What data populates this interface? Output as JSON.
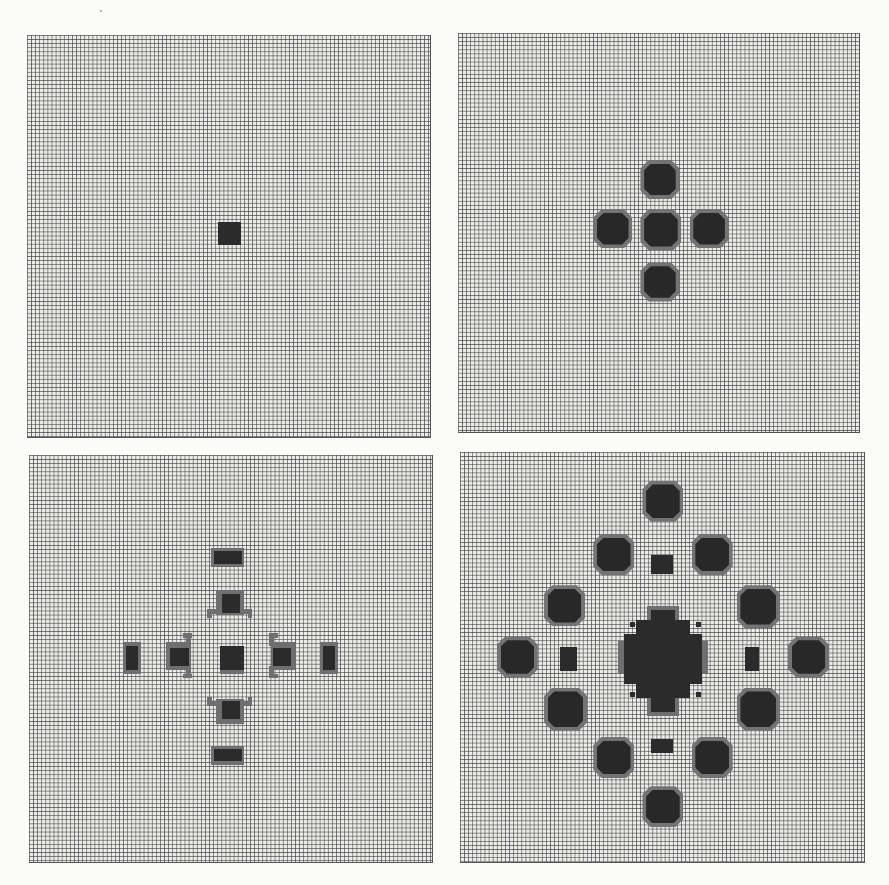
{
  "figure": {
    "background": "#fbfbfa",
    "grid_color": "#464646",
    "cell_fill_color": "#2b2b2b",
    "edge_fill_color": "#6f6f6f",
    "cell_px": 4.1,
    "grid_cells": 98
  },
  "panels": [
    {
      "id": "top-left",
      "label": "state-1",
      "x": 27,
      "y": 35,
      "w": 404,
      "h": 403,
      "rects": [
        {
          "col": 46.5,
          "row": 45.5,
          "w": 5.8,
          "h": 5.8,
          "tone": "core"
        }
      ],
      "blobs": []
    },
    {
      "id": "top-right",
      "label": "state-2",
      "x": 458,
      "y": 33,
      "w": 402,
      "h": 400,
      "rects": [],
      "blobs": [
        {
          "col": 44.5,
          "row": 31,
          "size": 9.5
        },
        {
          "col": 33,
          "row": 43,
          "size": 9.5
        },
        {
          "col": 44.5,
          "row": 43,
          "size": 10
        },
        {
          "col": 56.5,
          "row": 43,
          "size": 9.5
        },
        {
          "col": 44.5,
          "row": 56,
          "size": 9.5
        }
      ]
    },
    {
      "id": "bottom-left",
      "label": "state-3",
      "x": 29,
      "y": 455,
      "w": 404,
      "h": 408,
      "rects": [
        {
          "col": 45,
          "row": 23.5,
          "w": 7,
          "h": 3,
          "tone": "core"
        },
        {
          "col": 44.5,
          "row": 22.7,
          "w": 8,
          "h": 4.6,
          "tone": "halo"
        },
        {
          "col": 45,
          "row": 71.7,
          "w": 7,
          "h": 3,
          "tone": "core"
        },
        {
          "col": 44.5,
          "row": 70.9,
          "w": 8,
          "h": 4.6,
          "tone": "halo"
        },
        {
          "col": 23.6,
          "row": 46.5,
          "w": 3,
          "h": 6,
          "tone": "core"
        },
        {
          "col": 23,
          "row": 45.7,
          "w": 4.4,
          "h": 7.6,
          "tone": "halo"
        },
        {
          "col": 71.7,
          "row": 46.5,
          "w": 3,
          "h": 6,
          "tone": "core"
        },
        {
          "col": 71,
          "row": 45.7,
          "w": 4.4,
          "h": 7.6,
          "tone": "halo"
        },
        {
          "col": 47,
          "row": 34,
          "w": 4.5,
          "h": 4.5,
          "tone": "core"
        },
        {
          "col": 45.5,
          "row": 33,
          "w": 7,
          "h": 6,
          "tone": "halo"
        },
        {
          "col": 43.5,
          "row": 37.5,
          "w": 1.2,
          "h": 2.2,
          "tone": "halo"
        },
        {
          "col": 43.5,
          "row": 37.5,
          "w": 3,
          "h": 1.2,
          "tone": "halo"
        },
        {
          "col": 53.3,
          "row": 37.5,
          "w": 1.2,
          "h": 2.2,
          "tone": "halo"
        },
        {
          "col": 51.5,
          "row": 37.5,
          "w": 3,
          "h": 1.2,
          "tone": "halo"
        },
        {
          "col": 47,
          "row": 60,
          "w": 4.5,
          "h": 4.5,
          "tone": "core"
        },
        {
          "col": 45.5,
          "row": 59.5,
          "w": 7,
          "h": 6,
          "tone": "halo"
        },
        {
          "col": 43.5,
          "row": 59,
          "w": 1.2,
          "h": 2.2,
          "tone": "halo"
        },
        {
          "col": 43.5,
          "row": 60,
          "w": 3,
          "h": 1.2,
          "tone": "halo"
        },
        {
          "col": 53.3,
          "row": 59,
          "w": 1.2,
          "h": 2.2,
          "tone": "halo"
        },
        {
          "col": 51.5,
          "row": 60,
          "w": 3,
          "h": 1.2,
          "tone": "halo"
        },
        {
          "col": 34.5,
          "row": 47,
          "w": 4.5,
          "h": 4.5,
          "tone": "core"
        },
        {
          "col": 33.5,
          "row": 45.5,
          "w": 6,
          "h": 7,
          "tone": "halo"
        },
        {
          "col": 37.5,
          "row": 43.5,
          "w": 2.2,
          "h": 1.2,
          "tone": "halo"
        },
        {
          "col": 38.3,
          "row": 43.5,
          "w": 1.2,
          "h": 3,
          "tone": "halo"
        },
        {
          "col": 37.5,
          "row": 53.3,
          "w": 2.2,
          "h": 1.2,
          "tone": "halo"
        },
        {
          "col": 38.3,
          "row": 51.5,
          "w": 1.2,
          "h": 3,
          "tone": "halo"
        },
        {
          "col": 59.5,
          "row": 47,
          "w": 4.5,
          "h": 4.5,
          "tone": "core"
        },
        {
          "col": 59,
          "row": 45.5,
          "w": 6,
          "h": 7,
          "tone": "halo"
        },
        {
          "col": 58.5,
          "row": 43.5,
          "w": 2.2,
          "h": 1.2,
          "tone": "halo"
        },
        {
          "col": 58.5,
          "row": 43.5,
          "w": 1.2,
          "h": 3,
          "tone": "halo"
        },
        {
          "col": 58.5,
          "row": 53.3,
          "w": 2.2,
          "h": 1.2,
          "tone": "halo"
        },
        {
          "col": 58.5,
          "row": 51.5,
          "w": 1.2,
          "h": 3,
          "tone": "halo"
        },
        {
          "col": 46.5,
          "row": 46.5,
          "w": 6,
          "h": 6,
          "tone": "core"
        },
        {
          "col": 46.5,
          "row": 52.3,
          "w": 6,
          "h": 1.2,
          "tone": "halo"
        }
      ],
      "blobs": []
    },
    {
      "id": "bottom-right",
      "label": "state-4",
      "x": 460,
      "y": 452,
      "w": 405,
      "h": 411,
      "rects": [
        {
          "col": 46.5,
          "row": 25.2,
          "w": 5.5,
          "h": 4.5,
          "tone": "core"
        },
        {
          "col": 46.5,
          "row": 70,
          "w": 5.5,
          "h": 3.5,
          "tone": "core"
        },
        {
          "col": 24.5,
          "row": 47.5,
          "w": 4,
          "h": 6,
          "tone": "core"
        },
        {
          "col": 69.5,
          "row": 47.5,
          "w": 3.5,
          "h": 6,
          "tone": "core"
        },
        {
          "col": 46.5,
          "row": 38.5,
          "w": 6,
          "h": 25,
          "tone": "core"
        },
        {
          "col": 40,
          "row": 44.5,
          "w": 19,
          "h": 12,
          "tone": "core"
        },
        {
          "col": 43,
          "row": 41,
          "w": 13,
          "h": 19,
          "tone": "core"
        },
        {
          "col": 38.5,
          "row": 46,
          "w": 22,
          "h": 8,
          "tone": "halo"
        },
        {
          "col": 45.5,
          "row": 37.5,
          "w": 8,
          "h": 27,
          "tone": "halo"
        },
        {
          "col": 41.5,
          "row": 41.5,
          "w": 1.2,
          "h": 1.2,
          "tone": "core"
        },
        {
          "col": 57.5,
          "row": 41.5,
          "w": 1.2,
          "h": 1.2,
          "tone": "core"
        },
        {
          "col": 41.5,
          "row": 58.5,
          "w": 1.2,
          "h": 1.2,
          "tone": "core"
        },
        {
          "col": 57.5,
          "row": 58.5,
          "w": 1.2,
          "h": 1.2,
          "tone": "core"
        }
      ],
      "blobs": [
        {
          "col": 44.5,
          "row": 7,
          "size": 10
        },
        {
          "col": 32.5,
          "row": 20,
          "size": 10
        },
        {
          "col": 56.5,
          "row": 20,
          "size": 10
        },
        {
          "col": 20.5,
          "row": 32.5,
          "size": 10
        },
        {
          "col": 67.5,
          "row": 32.5,
          "size": 10.5
        },
        {
          "col": 9,
          "row": 45,
          "size": 10
        },
        {
          "col": 80,
          "row": 45,
          "size": 10
        },
        {
          "col": 20.5,
          "row": 57.5,
          "size": 10.5
        },
        {
          "col": 67.5,
          "row": 57.5,
          "size": 10.5
        },
        {
          "col": 32.5,
          "row": 69.5,
          "size": 10
        },
        {
          "col": 56.5,
          "row": 69.5,
          "size": 10
        },
        {
          "col": 44.5,
          "row": 81.5,
          "size": 10
        }
      ]
    }
  ]
}
